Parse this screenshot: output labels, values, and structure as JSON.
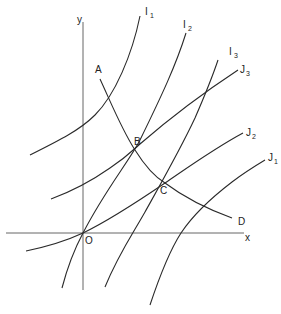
{
  "diagram": {
    "type": "indifference-curve-map",
    "axes": {
      "x_label": "x",
      "y_label": "y",
      "origin_label": "O"
    },
    "curve_families": [
      {
        "name": "I",
        "curves": [
          {
            "label": "I",
            "sub": "1"
          },
          {
            "label": "I",
            "sub": "2"
          },
          {
            "label": "I",
            "sub": "3"
          }
        ]
      },
      {
        "name": "J",
        "curves": [
          {
            "label": "J",
            "sub": "1"
          },
          {
            "label": "J",
            "sub": "2"
          },
          {
            "label": "J",
            "sub": "3"
          }
        ]
      }
    ],
    "contract_curve": {
      "start_label": "A",
      "end_label": "D",
      "points": [
        {
          "label": "B",
          "meets": [
            "I2",
            "J3"
          ]
        },
        {
          "label": "C",
          "meets": [
            "I3",
            "J2"
          ]
        }
      ]
    }
  }
}
